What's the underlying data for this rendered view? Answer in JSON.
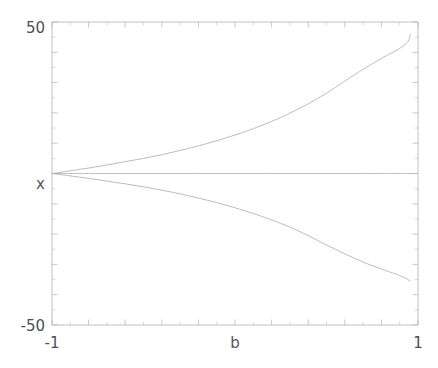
{
  "chart_data": {
    "type": "line",
    "title": "",
    "subtitle": "",
    "xlabel": "b",
    "ylabel": "x",
    "xlim": [
      -1,
      1
    ],
    "ylim": [
      -50,
      50
    ],
    "grid": false,
    "legend": null,
    "x_tick_labels": [
      "-1",
      "1"
    ],
    "y_tick_labels": [
      "50",
      "-50"
    ],
    "x_tick_label_left": "-1",
    "x_tick_label_right": "1",
    "y_tick_label_top": "50",
    "y_tick_label_bottom": "-50",
    "x_major_tick_step": 0.2,
    "x_minor_tick_step": 0.1,
    "y_major_tick_step": 10,
    "y_minor_tick_step": 5,
    "annotations": [],
    "series": [
      {
        "name": "trivial branch",
        "comment": "flat equilibrium x = 0 across all b",
        "x": [
          -1,
          -0.8,
          -0.6,
          -0.4,
          -0.2,
          0,
          0.2,
          0.4,
          0.6,
          0.8,
          0.95,
          1
        ],
        "values": [
          0,
          0,
          0,
          0,
          0,
          0,
          0,
          0,
          0,
          0,
          0,
          0
        ]
      },
      {
        "name": "upper branch",
        "comment": "positive branch diverging as b approaches 1",
        "x": [
          -1,
          -0.9,
          -0.8,
          -0.7,
          -0.6,
          -0.5,
          -0.4,
          -0.3,
          -0.2,
          -0.1,
          0,
          0.1,
          0.2,
          0.3,
          0.4,
          0.5,
          0.6,
          0.7,
          0.75,
          0.8,
          0.85,
          0.88,
          0.9,
          0.92,
          0.94,
          0.95,
          0.958
        ],
        "values": [
          0,
          0.9,
          1.8,
          2.8,
          3.9,
          5.0,
          6.2,
          7.6,
          9.1,
          10.8,
          12.7,
          14.8,
          17.2,
          19.9,
          23.0,
          26.5,
          30.5,
          34.4,
          36.2,
          38.0,
          39.6,
          40.5,
          41.3,
          42.1,
          43.2,
          44.1,
          45.8
        ]
      },
      {
        "name": "lower branch",
        "comment": "negative branch diverging as b approaches 1",
        "x": [
          -1,
          -0.9,
          -0.8,
          -0.7,
          -0.6,
          -0.5,
          -0.4,
          -0.3,
          -0.2,
          -0.1,
          0,
          0.1,
          0.2,
          0.3,
          0.4,
          0.5,
          0.6,
          0.7,
          0.75,
          0.8,
          0.85,
          0.88,
          0.9,
          0.92,
          0.94,
          0.95,
          0.955
        ],
        "values": [
          0,
          -0.8,
          -1.6,
          -2.5,
          -3.4,
          -4.4,
          -5.5,
          -6.7,
          -8.1,
          -9.6,
          -11.3,
          -13.2,
          -15.3,
          -17.7,
          -20.5,
          -23.6,
          -26.5,
          -29.2,
          -30.4,
          -31.5,
          -32.6,
          -33.2,
          -33.7,
          -34.2,
          -34.8,
          -35.2,
          -35.6
        ]
      }
    ]
  },
  "colors": {
    "curve": "#b0b0b5",
    "axis": "#b9b9bd",
    "label": "#4e4e53",
    "background": "#ffffff"
  }
}
